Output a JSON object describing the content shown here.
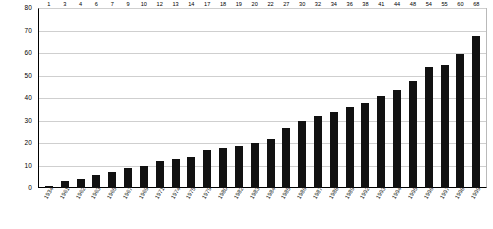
{
  "chart_data": {
    "type": "bar",
    "title": "",
    "subtitle": "",
    "xlabel": "",
    "ylabel": "",
    "ylim": [
      0,
      80
    ],
    "ytick_step": 10,
    "yticks": [
      0,
      10,
      20,
      30,
      40,
      50,
      60,
      70,
      80
    ],
    "grid": true,
    "legend": false,
    "legend_position": "none",
    "bar_color": "#111111",
    "categories": [
      "1934",
      "1961",
      "1962",
      "1963",
      "1965",
      "1967",
      "1969",
      "1971",
      "1974",
      "1975",
      "1979",
      "1980",
      "1982",
      "1983",
      "1984",
      "1985",
      "1986",
      "1987",
      "1988",
      "1989",
      "1992",
      "1993",
      "1994",
      "1995",
      "1996",
      "1997",
      "1998",
      "1999"
    ],
    "values": [
      1,
      3,
      4,
      6,
      7,
      9,
      10,
      12,
      13,
      14,
      17,
      18,
      19,
      20,
      22,
      27,
      30,
      32,
      34,
      36,
      38,
      41,
      44,
      48,
      54,
      55,
      60,
      68
    ],
    "data_labels_shown": true
  },
  "colors": {
    "bar": "#111111",
    "grid": "#cfcfcf",
    "axis": "#000000",
    "background": "#ffffff"
  }
}
